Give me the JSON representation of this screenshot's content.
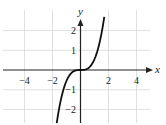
{
  "chart_data": {
    "type": "line",
    "title": "",
    "xlabel": "x",
    "ylabel": "y",
    "xlim": [
      -5.5,
      5
    ],
    "ylim": [
      -2.7,
      2.7
    ],
    "x_ticks": [
      -4,
      -2,
      2,
      4
    ],
    "x_tick_labels": [
      "−4",
      "−2",
      "2",
      "4"
    ],
    "y_ticks": [
      2,
      1,
      -1,
      -2
    ],
    "y_tick_labels": [
      "2",
      "1",
      "−1",
      "−2"
    ],
    "grid": true,
    "grid_x": [
      -4,
      -2,
      2,
      4
    ],
    "grid_y": [
      -2,
      -1,
      1,
      2
    ],
    "series": [
      {
        "name": "f(x)",
        "description": "cubic curve through origin, flat near 0",
        "function": "y = 0.55 x^3",
        "x_domain": [
          -1.7,
          1.7
        ],
        "points": [
          [
            -1.7,
            -2.7
          ],
          [
            -1.4,
            -1.5
          ],
          [
            -1.0,
            -0.55
          ],
          [
            -0.5,
            -0.07
          ],
          [
            0,
            0
          ],
          [
            0.5,
            0.07
          ],
          [
            1.0,
            0.55
          ],
          [
            1.4,
            1.5
          ],
          [
            1.7,
            2.7
          ]
        ]
      }
    ],
    "colors": {
      "curve": "#111111",
      "axis": "#222222",
      "grid": "#d8d8d8"
    }
  }
}
